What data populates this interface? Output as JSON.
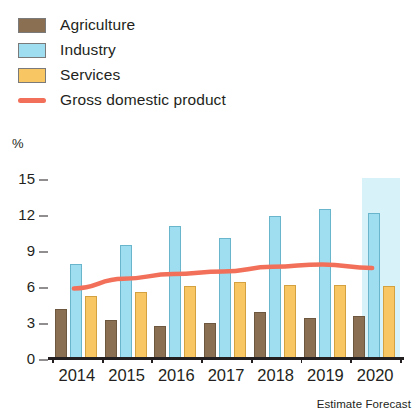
{
  "legend": {
    "items": [
      {
        "label": "Agriculture",
        "type": "swatch",
        "color": "#8a6f52"
      },
      {
        "label": "Industry",
        "type": "swatch",
        "color": "#9fdef0"
      },
      {
        "label": "Services",
        "type": "swatch",
        "color": "#f8c763"
      },
      {
        "label": "Gross domestic product",
        "type": "line",
        "color": "#f2705a"
      }
    ]
  },
  "axis": {
    "unit": "%",
    "yticks": [
      "15",
      "12",
      "9",
      "6",
      "3",
      "0"
    ]
  },
  "annotation": "Estimate Forecast",
  "chart_data": {
    "type": "bar",
    "title": "",
    "xlabel": "",
    "ylabel": "%",
    "ylim": [
      0,
      15
    ],
    "yticks": [
      0,
      3,
      6,
      9,
      12,
      15
    ],
    "grid": false,
    "legend_position": "top-left",
    "categories": [
      "2014",
      "2015",
      "2016",
      "2017",
      "2018",
      "2019",
      "2020"
    ],
    "series": [
      {
        "name": "Agriculture",
        "type": "bar",
        "color": "#8a6f52",
        "values": [
          4.1,
          3.2,
          2.7,
          2.9,
          3.8,
          3.3,
          3.5
        ]
      },
      {
        "name": "Industry",
        "type": "bar",
        "color": "#9fdef0",
        "values": [
          7.8,
          9.4,
          11.0,
          10.0,
          11.8,
          12.4,
          12.1
        ]
      },
      {
        "name": "Services",
        "type": "bar",
        "color": "#f8c763",
        "values": [
          5.2,
          5.5,
          6.0,
          6.3,
          6.1,
          6.1,
          6.0
        ]
      },
      {
        "name": "Gross domestic product",
        "type": "line",
        "color": "#f2705a",
        "values": [
          5.8,
          6.6,
          7.0,
          7.2,
          7.6,
          7.8,
          7.5
        ]
      }
    ],
    "annotations": [
      {
        "text": "Estimate Forecast",
        "position": "below-axis-right"
      },
      {
        "text": "forecast band",
        "covers": [
          "2020"
        ],
        "color": "#d8f2f9"
      }
    ]
  }
}
